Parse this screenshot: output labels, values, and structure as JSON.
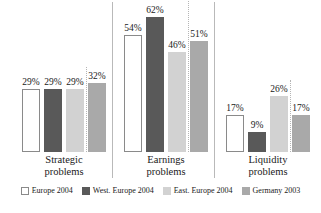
{
  "chart_data": {
    "type": "bar",
    "title": "",
    "subtitle": "",
    "xlabel": "",
    "ylabel": "",
    "ylim": [
      0,
      70
    ],
    "grid": false,
    "legend_position": "bottom",
    "value_suffix": "%",
    "categories": [
      "Strategic problems",
      "Earnings problems",
      "Liquidity problems"
    ],
    "category_lines": [
      [
        "Strategic",
        "problems"
      ],
      [
        "Earnings",
        "problems"
      ],
      [
        "Liquidity",
        "problems"
      ]
    ],
    "series": [
      {
        "name": "Europe 2004",
        "color": "#ffffff",
        "values": [
          29,
          54,
          17
        ],
        "labels": [
          "29%",
          "54%",
          "17%"
        ]
      },
      {
        "name": "West. Europe 2004",
        "color": "#595959",
        "values": [
          29,
          62,
          9
        ],
        "labels": [
          "29%",
          "62%",
          "9%"
        ]
      },
      {
        "name": "East. Europe 2004",
        "color": "#d2d2d2",
        "values": [
          29,
          46,
          26
        ],
        "labels": [
          "29%",
          "46%",
          "26%"
        ]
      },
      {
        "name": "Germany 2003",
        "color": "#a9a9a9",
        "values": [
          32,
          51,
          17
        ],
        "labels": [
          "32%",
          "51%",
          "17%"
        ]
      }
    ]
  },
  "legend": {
    "items": [
      {
        "label": "Europe 2004"
      },
      {
        "label": "West. Europe 2004"
      },
      {
        "label": "East. Europe 2004"
      },
      {
        "label": "Germany 2003"
      }
    ]
  }
}
